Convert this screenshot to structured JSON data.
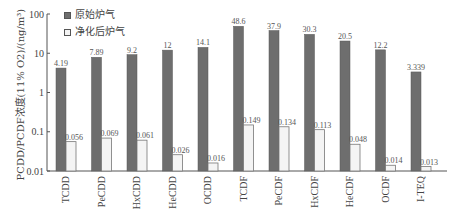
{
  "chart_data": {
    "type": "bar",
    "title": "",
    "xlabel": "",
    "ylabel": "PCDD/PCDF浓度(11% O2)/(ng/m³)",
    "yscale": "log",
    "ylim": [
      0.01,
      100
    ],
    "yticks": [
      "0.01",
      "0.1",
      "1",
      "10",
      "100"
    ],
    "grid": false,
    "legend_position": "top-left",
    "categories": [
      "TCDD",
      "PeCDD",
      "HxCDD",
      "HeCDD",
      "OCDD",
      "TCDF",
      "PeCDF",
      "HxCDF",
      "HeCDF",
      "OCDF",
      "I-TEQ"
    ],
    "series": [
      {
        "name": "原始炉气",
        "color": "#6e6e6e",
        "values": [
          4.19,
          7.89,
          9.2,
          12,
          14.1,
          48.6,
          37.9,
          30.3,
          20.5,
          12.2,
          3.339
        ],
        "labels": [
          "4.19",
          "7.89",
          "9.2",
          "12",
          "14.1",
          "48.6",
          "37.9",
          "30.3",
          "20.5",
          "12.2",
          "3.339"
        ]
      },
      {
        "name": "净化后炉气",
        "color": "#f4f4f4",
        "values": [
          0.056,
          0.069,
          0.061,
          0.026,
          0.016,
          0.149,
          0.134,
          0.113,
          0.048,
          0.014,
          0.013
        ],
        "labels": [
          "0.056",
          "0.069",
          "0.061",
          "0.026",
          "0.016",
          "0.149",
          "0.134",
          "0.113",
          "0.048",
          "0.014",
          "0.013"
        ]
      }
    ]
  }
}
